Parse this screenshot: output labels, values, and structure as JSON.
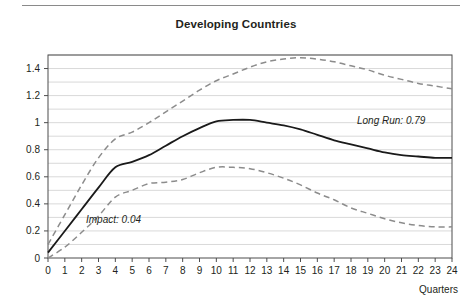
{
  "figure": {
    "title": "Developing Countries",
    "quarters_axis_label": "Quarters"
  },
  "annotations": {
    "long_run": "Long Run: 0.79",
    "impact": "Impact: 0.04"
  },
  "colors": {
    "axis": "#4d4d4d",
    "grid": "#d9d9d9",
    "solid_line": "#1a1a1a",
    "band_line": "#8c8c8c",
    "text": "#231f20",
    "top_rule": "#8a8a8a"
  },
  "chart_data": {
    "type": "line",
    "title": "Developing Countries",
    "xlabel": "Quarters",
    "ylabel": "",
    "xlim": [
      0,
      24
    ],
    "ylim": [
      0,
      1.5
    ],
    "grid": true,
    "grid_minor_step": 0.1,
    "legend": "none",
    "x": [
      0,
      1,
      2,
      3,
      4,
      5,
      6,
      7,
      8,
      9,
      10,
      11,
      12,
      13,
      14,
      15,
      16,
      17,
      18,
      19,
      20,
      21,
      22,
      23,
      24
    ],
    "xticks": [
      "0",
      "1",
      "2",
      "3",
      "4",
      "5",
      "6",
      "7",
      "8",
      "9",
      "10",
      "11",
      "12",
      "13",
      "14",
      "15",
      "16",
      "17",
      "18",
      "19",
      "20",
      "21",
      "22",
      "23",
      "24"
    ],
    "yticks": [
      "0",
      "0.2",
      "0.4",
      "0.6",
      "0.8",
      "1",
      "1.2",
      "1.4"
    ],
    "ytick_values": [
      0,
      0.2,
      0.4,
      0.6,
      0.8,
      1.0,
      1.2,
      1.4
    ],
    "series": [
      {
        "name": "Point estimate",
        "style": "solid",
        "color": "#1a1a1a",
        "values": [
          0.04,
          0.2,
          0.36,
          0.52,
          0.67,
          0.71,
          0.76,
          0.83,
          0.9,
          0.96,
          1.01,
          1.02,
          1.02,
          1.0,
          0.98,
          0.95,
          0.91,
          0.87,
          0.84,
          0.81,
          0.78,
          0.76,
          0.75,
          0.74,
          0.74
        ]
      },
      {
        "name": "Upper confidence band",
        "style": "dashed",
        "color": "#8c8c8c",
        "values": [
          0.1,
          0.32,
          0.54,
          0.74,
          0.88,
          0.93,
          1.0,
          1.08,
          1.16,
          1.24,
          1.31,
          1.36,
          1.41,
          1.45,
          1.47,
          1.48,
          1.47,
          1.45,
          1.42,
          1.39,
          1.35,
          1.32,
          1.29,
          1.27,
          1.25
        ]
      },
      {
        "name": "Lower confidence band",
        "style": "dashed",
        "color": "#8c8c8c",
        "values": [
          0.0,
          0.08,
          0.19,
          0.31,
          0.45,
          0.5,
          0.55,
          0.56,
          0.58,
          0.63,
          0.67,
          0.67,
          0.66,
          0.63,
          0.59,
          0.54,
          0.48,
          0.43,
          0.37,
          0.33,
          0.29,
          0.26,
          0.24,
          0.23,
          0.23
        ]
      }
    ],
    "annotations": [
      {
        "text": "Long Run: 0.79",
        "x": 20.5,
        "y": 0.97
      },
      {
        "text": "Impact: 0.04",
        "x": 3.0,
        "y": 0.265
      }
    ]
  }
}
